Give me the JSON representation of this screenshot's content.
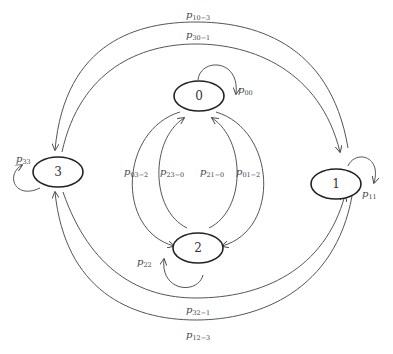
{
  "diagram": {
    "type": "state-transition",
    "nodes": [
      {
        "id": "0",
        "label": "0"
      },
      {
        "id": "1",
        "label": "1"
      },
      {
        "id": "2",
        "label": "2"
      },
      {
        "id": "3",
        "label": "3"
      }
    ],
    "edges": [
      {
        "from": "1",
        "to": "3",
        "label": "p",
        "sub": "10−3"
      },
      {
        "from": "3",
        "to": "1",
        "label": "p",
        "sub": "30−1"
      },
      {
        "from": "0",
        "to": "0",
        "label": "p",
        "sub": "00"
      },
      {
        "from": "3",
        "to": "3",
        "label": "p",
        "sub": "33"
      },
      {
        "from": "1",
        "to": "1",
        "label": "p",
        "sub": "11"
      },
      {
        "from": "0",
        "to": "2",
        "label": "p",
        "sub": "03−2"
      },
      {
        "from": "2",
        "to": "0",
        "label": "p",
        "sub": "23−0"
      },
      {
        "from": "2",
        "to": "0",
        "label": "p",
        "sub": "21−0"
      },
      {
        "from": "0",
        "to": "2",
        "label": "p",
        "sub": "01−2"
      },
      {
        "from": "2",
        "to": "2",
        "label": "p",
        "sub": "22"
      },
      {
        "from": "3",
        "to": "1",
        "label": "p",
        "sub": "32−1"
      },
      {
        "from": "1",
        "to": "3",
        "label": "p",
        "sub": "12−3"
      }
    ]
  }
}
